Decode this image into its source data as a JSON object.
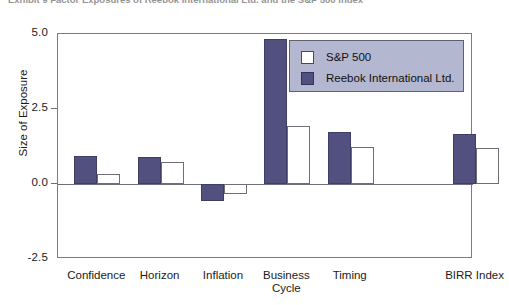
{
  "caption": {
    "text": "Exhibit 9  Factor Exposures of Reebok International Ltd. and the S&P 500 Index"
  },
  "chart_data": {
    "type": "bar",
    "title": "",
    "xlabel": "",
    "ylabel": "Size of Exposure",
    "categories": [
      "Confidence",
      "Horizon",
      "Inflation",
      "Business\nCycle",
      "Timing",
      "BIRR Index"
    ],
    "series": [
      {
        "name": "S&P 500",
        "color": "#ffffff",
        "values": [
          0.33,
          0.75,
          -0.33,
          1.92,
          1.25,
          1.2
        ]
      },
      {
        "name": "Reebok International Ltd.",
        "color": "#51507f",
        "values": [
          0.92,
          0.9,
          -0.57,
          4.85,
          1.72,
          1.68
        ]
      }
    ],
    "ylim": [
      -2.5,
      5.0
    ],
    "yticks": [
      "-2.5",
      "0.0",
      "2.5",
      "5.0"
    ],
    "ytick_values": [
      -2.5,
      0.0,
      2.5,
      5.0
    ],
    "grid": false,
    "legend_position": "top-right",
    "gap_before_last_category": true
  },
  "legend": {
    "entries": [
      {
        "label": "S&P 500",
        "swatch": "white-square"
      },
      {
        "label": "Reebok International Ltd.",
        "swatch": "indigo-square"
      }
    ]
  },
  "colors": {
    "reebok_bar": "#51507f",
    "sp_bar": "#ffffff",
    "legend_background": "#b3b7cf",
    "axis": "#6e6e78",
    "text": "#1a1a1a"
  }
}
